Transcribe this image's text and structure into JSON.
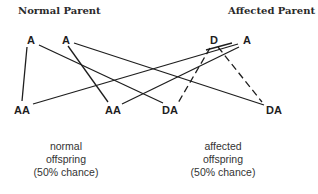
{
  "titles": {
    "normal_parent": "Normal Parent",
    "affected_parent": "Affected Parent"
  },
  "parents": {
    "normal": [
      {
        "label": "A",
        "x": 30,
        "y": 40
      },
      {
        "label": "A",
        "x": 66,
        "y": 40
      }
    ],
    "affected": [
      {
        "label": "D",
        "x": 214,
        "y": 40
      },
      {
        "label": "A",
        "x": 246,
        "y": 40
      }
    ]
  },
  "offspring": [
    {
      "label": "AA",
      "x": 22,
      "y": 110
    },
    {
      "label": "AA",
      "x": 113,
      "y": 110
    },
    {
      "label": "DA",
      "x": 170,
      "y": 110
    },
    {
      "label": "DA",
      "x": 273,
      "y": 110
    }
  ],
  "captions": {
    "normal": [
      "normal",
      "offspring",
      "(50% chance)"
    ],
    "affected": [
      "affected",
      "offspring",
      "(50% chance)"
    ]
  },
  "colors": {
    "line": "#1e1e1e",
    "text": "#1e1e1e"
  }
}
